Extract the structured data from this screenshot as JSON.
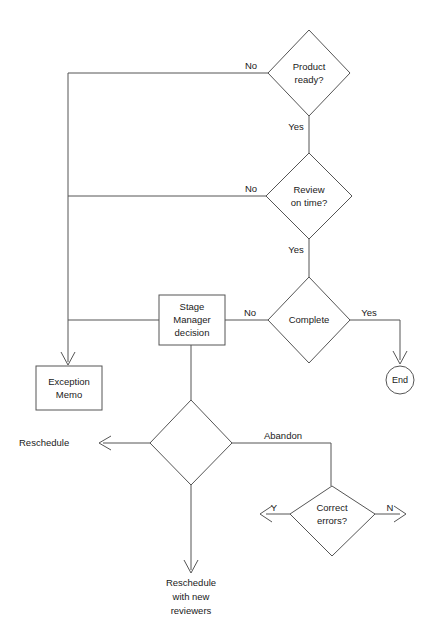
{
  "diagram": {
    "background_color": "#ffffff",
    "line_color": "#555555",
    "text_color": "#1a1a1a"
  },
  "nodes": {
    "product_ready": {
      "label_line1": "Product",
      "label_line2": "ready?",
      "shape": "decision"
    },
    "review_on_time": {
      "label_line1": "Review",
      "label_line2": "on  time?",
      "shape": "decision"
    },
    "complete": {
      "label_line1": "Complete",
      "shape": "decision"
    },
    "stage_manager": {
      "label_line1": "Stage",
      "label_line2": "Manager",
      "label_line3": "decision",
      "shape": "process"
    },
    "exception_memo": {
      "label_line1": "Exception",
      "label_line2": "Memo",
      "shape": "process"
    },
    "end_node": {
      "label": "End",
      "shape": "terminator"
    },
    "unlabeled_decision": {
      "label": "",
      "shape": "decision"
    },
    "correct_errors": {
      "label_line1": "Correct",
      "label_line2": "errors?",
      "shape": "decision"
    }
  },
  "edge_labels": {
    "product_no": "No",
    "product_yes": "Yes",
    "review_no": "No",
    "review_yes": "Yes",
    "complete_no": "No",
    "complete_yes": "Yes",
    "abandon": "Abandon",
    "correct_yes": "Y",
    "correct_no": "N"
  },
  "free_labels": {
    "reschedule": "Reschedule",
    "reschedule_new_1": "Reschedule",
    "reschedule_new_2": "with  new",
    "reschedule_new_3": "reviewers"
  }
}
